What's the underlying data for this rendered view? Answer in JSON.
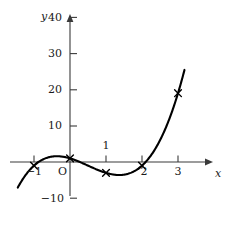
{
  "chart_data": {
    "type": "line",
    "title": "",
    "xlabel": "x",
    "ylabel": "y",
    "xlim": [
      -1.45,
      3.75
    ],
    "ylim": [
      -11.5,
      41.5
    ],
    "grid": false,
    "legend": null,
    "curve_equation": "y = 2x^3 - 3x^2 - 3x + 1",
    "x": [
      -1,
      0,
      1,
      2,
      3
    ],
    "values": [
      -8,
      1,
      -2,
      0,
      35
    ],
    "marked_points": [
      {
        "x": -1,
        "y": -8,
        "marker": "x"
      },
      {
        "x": 0,
        "y": 1,
        "marker": "x"
      },
      {
        "x": 1,
        "y": -2,
        "marker": "x"
      },
      {
        "x": 2,
        "y": 0,
        "marker": "x"
      },
      {
        "x": 3,
        "y": 35,
        "marker": "x"
      }
    ],
    "y_ticks": [
      {
        "value": 40,
        "label": "40"
      },
      {
        "value": 30,
        "label": "30"
      },
      {
        "value": 20,
        "label": "20"
      },
      {
        "value": 10,
        "label": "10"
      },
      {
        "value": -10,
        "label": "−10"
      }
    ],
    "x_ticks": [
      {
        "value": -1,
        "label": "−1"
      },
      {
        "value": 1,
        "label": "1"
      },
      {
        "value": 2,
        "label": "2"
      },
      {
        "value": 3,
        "label": "3"
      }
    ],
    "origin_label": "O",
    "curve_color": "#000000",
    "axis_color": "#3a3a3a",
    "marker_color": "#000000",
    "background_color": "#ffffff"
  },
  "axes": {
    "x_axis_name": "x",
    "y_axis_name": "y"
  }
}
